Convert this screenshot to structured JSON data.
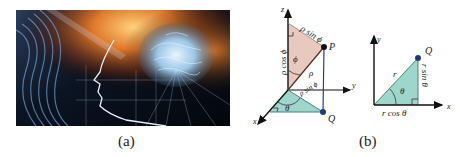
{
  "panels": {
    "a": {
      "caption": "(a)",
      "image_description": "brain-and-profile-digital-art"
    },
    "b": {
      "caption": "(b)",
      "spherical": {
        "axes": {
          "z": "z",
          "y": "y",
          "x": "x"
        },
        "points": {
          "P": "P",
          "Q": "Q"
        },
        "labels": {
          "rho_sin_phi_top": "ρ sin ϕ",
          "rho_cos_phi": "ρ cos ϕ",
          "phi": "ϕ",
          "rho": "ρ",
          "rho_sin_phi_base": "ρ sin ϕ",
          "theta": "θ"
        }
      },
      "polar": {
        "axes": {
          "y": "y",
          "x": "x"
        },
        "points": {
          "Q": "Q"
        },
        "labels": {
          "r": "r",
          "theta": "θ",
          "r_sin_theta": "r sin θ",
          "r_cos_theta": "r cos θ"
        }
      }
    }
  },
  "colors": {
    "pink_fill": "#e8c9bf",
    "teal_fill": "#9fd6cc",
    "point_dark": "#111111",
    "point_blue": "#1f3a7a",
    "axis": "#111111",
    "projection_line": "#2c3e8c"
  }
}
